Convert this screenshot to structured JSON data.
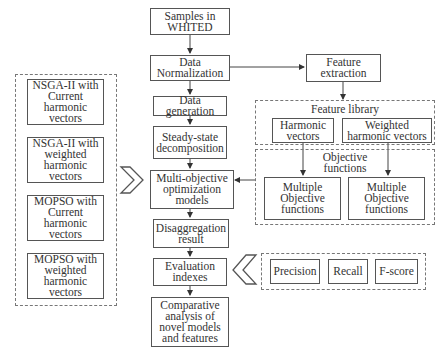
{
  "main_flow": {
    "samples": "Samples in\nWHITED",
    "normalization": "Data\nNormalization",
    "generation": "Data generation",
    "steady_state": "Steady-state\ndecomposition",
    "multi_objective": "Multi-objective\noptimization\nmodels",
    "disaggregation": "Disaggregation\nresult",
    "evaluation": "Evaluation\nindexes",
    "comparative": "Comparative\nanalysis of\nnovel models\nand features"
  },
  "feature_extraction": "Feature\nextraction",
  "feature_library": {
    "title": "Feature library",
    "items": [
      "Harmonic\nvectors",
      "Weighted\nharmonic vectors"
    ]
  },
  "objective_functions": {
    "title": "Objective\nfunctions",
    "items": [
      "Multiple\nObjective\nfunctions",
      "Multiple\nObjective\nfunctions"
    ]
  },
  "models_group": {
    "items": [
      "NSGA-II with\nCurrent\nharmonic\nvectors",
      "NSGA-II  with\nweighted\nharmonic\nvectors",
      "MOPSO with\nCurrent\nharmonic\nvectors",
      "MOPSO with\nweighted\nharmonic\nvectors"
    ]
  },
  "metrics_group": {
    "items": [
      "Precision",
      "Recall",
      "F-score"
    ]
  }
}
